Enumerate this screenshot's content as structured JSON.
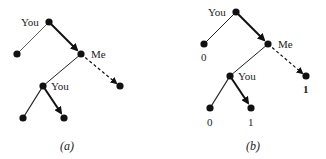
{
  "figure": {
    "panels": [
      {
        "id": "a",
        "caption": "(a)",
        "nodes": [
          {
            "id": "root",
            "x": 49,
            "y": 22,
            "label": "You"
          },
          {
            "id": "leaf-left",
            "x": 17,
            "y": 54
          },
          {
            "id": "me",
            "x": 81,
            "y": 54,
            "label": "Me"
          },
          {
            "id": "you-inner",
            "x": 43,
            "y": 86,
            "label": "You"
          },
          {
            "id": "dash-leaf",
            "x": 120,
            "y": 86
          },
          {
            "id": "bottom-left",
            "x": 23,
            "y": 118
          },
          {
            "id": "bottom-right",
            "x": 64,
            "y": 118
          }
        ],
        "edges": [
          {
            "from": "root",
            "to": "leaf-left",
            "style": "thin"
          },
          {
            "from": "root",
            "to": "me",
            "style": "thick-arrow"
          },
          {
            "from": "me",
            "to": "you-inner",
            "style": "normal"
          },
          {
            "from": "me",
            "to": "dash-leaf",
            "style": "dashed-arrow"
          },
          {
            "from": "you-inner",
            "to": "bottom-left",
            "style": "normal"
          },
          {
            "from": "you-inner",
            "to": "bottom-right",
            "style": "thick-arrow"
          }
        ]
      },
      {
        "id": "b",
        "caption": "(b)",
        "nodes": [
          {
            "id": "root",
            "x": 236,
            "y": 12,
            "label": "You"
          },
          {
            "id": "leaf-left",
            "x": 204,
            "y": 44,
            "value": "0"
          },
          {
            "id": "me",
            "x": 268,
            "y": 44,
            "label": "Me"
          },
          {
            "id": "you-inner",
            "x": 230,
            "y": 76,
            "label": "You"
          },
          {
            "id": "dash-leaf",
            "x": 306,
            "y": 76,
            "value": "1",
            "bold": true
          },
          {
            "id": "bottom-left",
            "x": 210,
            "y": 108,
            "value": "0"
          },
          {
            "id": "bottom-right",
            "x": 251,
            "y": 108,
            "value": "1"
          }
        ],
        "edges": [
          {
            "from": "root",
            "to": "leaf-left",
            "style": "normal"
          },
          {
            "from": "root",
            "to": "me",
            "style": "thick-arrow"
          },
          {
            "from": "me",
            "to": "you-inner",
            "style": "normal"
          },
          {
            "from": "me",
            "to": "dash-leaf",
            "style": "dashed-arrow"
          },
          {
            "from": "you-inner",
            "to": "bottom-left",
            "style": "normal"
          },
          {
            "from": "you-inner",
            "to": "bottom-right",
            "style": "thick-arrow"
          }
        ]
      }
    ],
    "labels": {
      "a_root": "You",
      "a_me": "Me",
      "a_you": "You",
      "a_caption": "(a)",
      "b_root": "You",
      "b_me": "Me",
      "b_you": "You",
      "b_leaf_left": "0",
      "b_dash_leaf": "1",
      "b_bottom_left": "0",
      "b_bottom_right": "1",
      "b_caption": "(b)"
    }
  }
}
